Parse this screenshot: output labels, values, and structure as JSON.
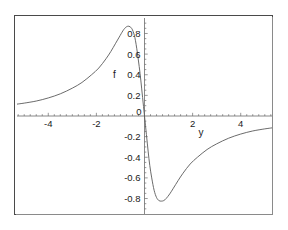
{
  "figure": {
    "background_color": "#ffffff",
    "frame_color": "#4a4a4a",
    "curve_color": "#5a5a5a",
    "axis_color": "#6b6b6b"
  },
  "chart_data": {
    "type": "line",
    "title": "",
    "subtitle": "",
    "xlabel": "y",
    "ylabel": "f",
    "xlim": [
      -5.3,
      5.3
    ],
    "ylim": [
      -0.95,
      0.95
    ],
    "grid": false,
    "legend": null,
    "x_ticks": [
      -4,
      -2,
      0,
      2,
      4
    ],
    "x_tick_labels": [
      "-4",
      "-2",
      "0",
      "2",
      "4"
    ],
    "y_ticks": [
      0.8,
      0.6,
      0.4,
      0.2,
      0,
      -0.2,
      -0.4,
      -0.6,
      -0.8
    ],
    "y_tick_labels": [
      "0.8",
      "0.6",
      "0.4",
      "0.2",
      "0",
      "-0.2",
      "-0.4",
      "-0.6",
      "-0.8"
    ],
    "x_minor_tick_interval": 0.25,
    "y_minor_tick_interval": 0.05,
    "axis_label_x_position": "right-of-origin-near-2",
    "axis_label_y_position": "left-of-0.4-tick",
    "series": [
      {
        "name": "f(y)",
        "x": [
          -5.3,
          -5.0,
          -4.5,
          -4.0,
          -3.5,
          -3.0,
          -2.6,
          -2.2,
          -1.9,
          -1.6,
          -1.4,
          -1.2,
          -1.05,
          -0.9,
          -0.8,
          -0.7,
          -0.6,
          -0.5,
          -0.4,
          -0.3,
          -0.22,
          -0.15,
          -0.08,
          0.0,
          0.08,
          0.15,
          0.22,
          0.3,
          0.4,
          0.5,
          0.6,
          0.7,
          0.8,
          0.9,
          1.05,
          1.2,
          1.4,
          1.6,
          1.9,
          2.2,
          2.6,
          3.0,
          3.5,
          4.0,
          4.5,
          5.0,
          5.3
        ],
        "y": [
          0.115,
          0.125,
          0.145,
          0.175,
          0.215,
          0.27,
          0.325,
          0.4,
          0.465,
          0.555,
          0.625,
          0.705,
          0.765,
          0.825,
          0.855,
          0.87,
          0.865,
          0.835,
          0.76,
          0.62,
          0.48,
          0.34,
          0.18,
          0.0,
          -0.18,
          -0.34,
          -0.48,
          -0.6,
          -0.72,
          -0.79,
          -0.82,
          -0.825,
          -0.82,
          -0.8,
          -0.755,
          -0.7,
          -0.625,
          -0.555,
          -0.465,
          -0.4,
          -0.325,
          -0.27,
          -0.215,
          -0.175,
          -0.145,
          -0.125,
          -0.115
        ]
      }
    ]
  }
}
